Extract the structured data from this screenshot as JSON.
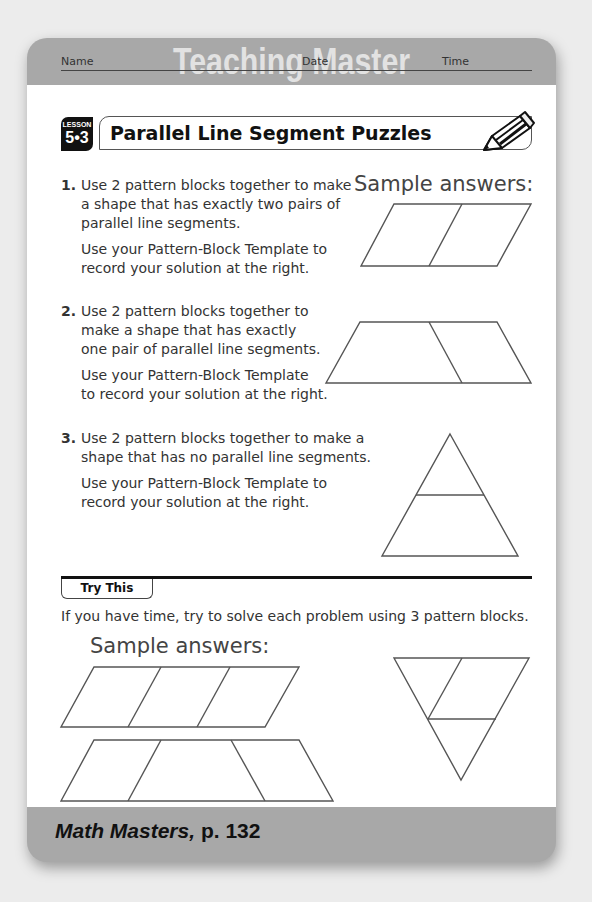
{
  "header": {
    "title": "Teaching Master"
  },
  "fields": {
    "name": "Name",
    "date": "Date",
    "time": "Time"
  },
  "lesson": {
    "label": "LESSON",
    "number": "5•3"
  },
  "title": "Parallel Line Segment Puzzles",
  "icons": {
    "pencil": "pencil-icon"
  },
  "problems": [
    {
      "num": "1.",
      "lines": [
        "Use 2 pattern blocks together to make",
        "a shape that has exactly two pairs of",
        "parallel line segments."
      ],
      "instruction": [
        "Use your Pattern-Block Template to",
        "record your solution at the right."
      ]
    },
    {
      "num": "2.",
      "lines": [
        "Use 2 pattern blocks together to",
        "make a shape that has exactly",
        "one pair of parallel line segments."
      ],
      "instruction": [
        "Use your Pattern-Block Template",
        "to record your solution at the right."
      ]
    },
    {
      "num": "3.",
      "lines": [
        "Use 2 pattern blocks together to make a",
        "shape that has no parallel line segments."
      ],
      "instruction": [
        "Use your Pattern-Block Template to",
        "record your solution at the right."
      ]
    }
  ],
  "sample_answers_label": "Sample answers:",
  "try_this": {
    "label": "Try This",
    "text": "If you have time, try to solve each problem using 3 pattern blocks.",
    "sample_answers_label": "Sample answers:"
  },
  "footer": {
    "book": "Math Masters,",
    "page": " p. 132"
  }
}
